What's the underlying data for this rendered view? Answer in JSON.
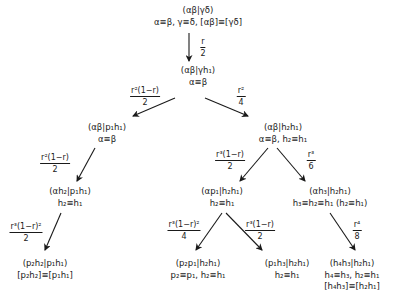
{
  "diagram": {
    "nodes": [
      {
        "id": "root",
        "x": 198,
        "y": 5,
        "lines": [
          "(αβ|γδ)",
          "α≡β, γ≡δ, [αβ]≡[γδ]"
        ]
      },
      {
        "id": "n1",
        "x": 198,
        "y": 65,
        "lines": [
          "(αβ|γh₁)",
          "α≡β"
        ]
      },
      {
        "id": "n2",
        "x": 107,
        "y": 122,
        "lines": [
          "(αβ|p₁h₁)",
          "α≡β"
        ]
      },
      {
        "id": "n3",
        "x": 283,
        "y": 122,
        "lines": [
          "(αβ|h₂h₁)",
          "α≡β, h₂≡h₁"
        ]
      },
      {
        "id": "n4",
        "x": 70,
        "y": 186,
        "lines": [
          "(αh₂|p₁h₁)",
          "h₂≡h₁"
        ]
      },
      {
        "id": "n5",
        "x": 222,
        "y": 186,
        "lines": [
          "(αp₁|h₂h₁)",
          "h₂≡h₁"
        ]
      },
      {
        "id": "n6",
        "x": 325,
        "y": 186,
        "lines": [
          "(αh₃|h₂h₁)",
          "h₃≡h₂≡h₁  (h₂≡h₁)"
        ]
      },
      {
        "id": "n7",
        "x": 45,
        "y": 258,
        "lines": [
          "(p₂h₂|p₁h₁)",
          "[p₂h₂]≡[p₁h₁]"
        ]
      },
      {
        "id": "n8",
        "x": 212,
        "y": 258,
        "lines": [
          "(p₂p₁|h₂h₁)",
          "p₂≡p₁, h₂≡h₁"
        ]
      },
      {
        "id": "n9",
        "x": 287,
        "y": 258,
        "lines": [
          "(p₁h₃|h₂h₁)",
          "h₂≡h₁"
        ]
      },
      {
        "id": "n10",
        "x": 352,
        "y": 258,
        "lines": [
          "(h₄h₃|h₂h₁)",
          "h₄≡h₃, h₂≡h₁",
          "[h₄h₃]≡[h₂h₁]"
        ]
      }
    ],
    "edges": [
      {
        "from": "root",
        "to": "n1",
        "x1": 189,
        "y1": 33,
        "x2": 189,
        "y2": 61,
        "label": {
          "num": "r",
          "den": "2",
          "x": 203,
          "y": 37
        }
      },
      {
        "from": "n1",
        "to": "n2",
        "x1": 175,
        "y1": 98,
        "x2": 133,
        "y2": 116,
        "label": {
          "num": "r²(1−r)",
          "den": "2",
          "x": 145,
          "y": 88
        }
      },
      {
        "from": "n1",
        "to": "n3",
        "x1": 205,
        "y1": 98,
        "x2": 248,
        "y2": 116,
        "label": {
          "num": "r²",
          "den": "4",
          "x": 241,
          "y": 88
        }
      },
      {
        "from": "n2",
        "to": "n4",
        "x1": 95,
        "y1": 148,
        "x2": 77,
        "y2": 181,
        "label": {
          "num": "r²(1−r)",
          "den": "2",
          "x": 53,
          "y": 155
        }
      },
      {
        "from": "n3",
        "to": "n5",
        "x1": 268,
        "y1": 148,
        "x2": 240,
        "y2": 181,
        "label": {
          "num": "r³(1−r)",
          "den": "2",
          "x": 230,
          "y": 152
        }
      },
      {
        "from": "n3",
        "to": "n6",
        "x1": 277,
        "y1": 148,
        "x2": 305,
        "y2": 181,
        "label": {
          "num": "r³",
          "den": "6",
          "x": 311,
          "y": 152
        }
      },
      {
        "from": "n4",
        "to": "n7",
        "x1": 61,
        "y1": 213,
        "x2": 45,
        "y2": 250,
        "label": {
          "num": "r³(1−r)²",
          "den": "2",
          "x": 26,
          "y": 223
        }
      },
      {
        "from": "n5",
        "to": "n8",
        "x1": 222,
        "y1": 213,
        "x2": 196,
        "y2": 250,
        "label": {
          "num": "r³(1−r)²",
          "den": "4",
          "x": 183,
          "y": 223
        }
      },
      {
        "from": "n5",
        "to": "n9",
        "x1": 226,
        "y1": 213,
        "x2": 262,
        "y2": 250,
        "label": {
          "num": "r³(1−r)",
          "den": "2",
          "x": 260,
          "y": 223
        }
      },
      {
        "from": "n6",
        "to": "n10",
        "x1": 330,
        "y1": 213,
        "x2": 355,
        "y2": 250,
        "label": {
          "num": "r⁴",
          "den": "8",
          "x": 357,
          "y": 223
        }
      }
    ]
  }
}
